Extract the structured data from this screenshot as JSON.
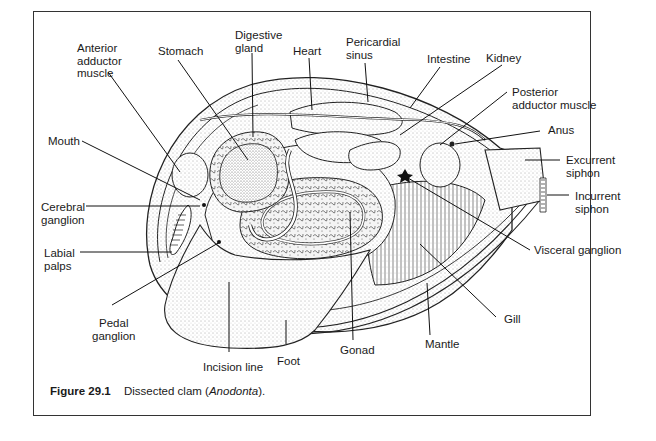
{
  "figure": {
    "number": "Figure 29.1",
    "caption_prefix": "Dissected clam (",
    "caption_genus": "Anodonta",
    "caption_suffix": ")."
  },
  "labels": {
    "anterior_adductor_muscle": "Anterior\nadductor\nmuscle",
    "stomach": "Stomach",
    "digestive_gland": "Digestive\ngland",
    "heart": "Heart",
    "pericardial_sinus": "Pericardial\nsinus",
    "intestine": "Intestine",
    "kidney": "Kidney",
    "posterior_adductor_muscle": "Posterior\nadductor muscle",
    "anus": "Anus",
    "excurrent_siphon": "Excurrent\nsiphon",
    "incurrent_siphon": "Incurrent\nsiphon",
    "mouth": "Mouth",
    "cerebral_ganglion": "Cerebral\nganglion",
    "labial_palps": "Labial\npalps",
    "visceral_ganglion": "Visceral ganglion",
    "pedal_ganglion": "Pedal\nganglion",
    "gill": "Gill",
    "mantle": "Mantle",
    "gonad": "Gonad",
    "foot": "Foot",
    "incision_line": "Incision line"
  }
}
